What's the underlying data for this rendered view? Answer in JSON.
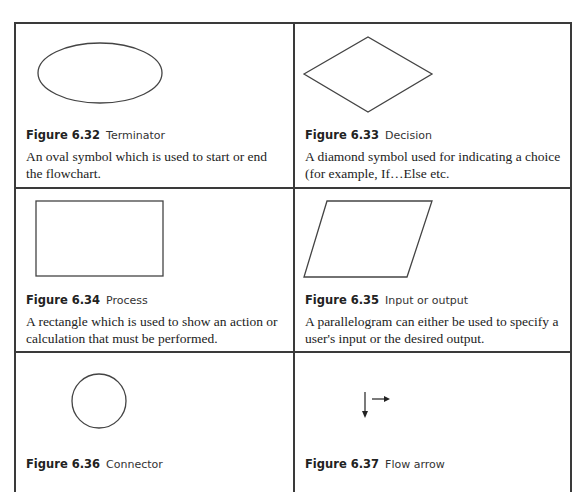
{
  "figures": [
    {
      "number": "Figure 6.32",
      "name": "Terminator",
      "shape": "oval-icon",
      "description": "An oval symbol which is used to start or end the flowchart."
    },
    {
      "number": "Figure 6.33",
      "name": "Decision",
      "shape": "diamond-icon",
      "description": "A diamond symbol used for indicating a choice (for example, If…Else etc."
    },
    {
      "number": "Figure 6.34",
      "name": "Process",
      "shape": "rectangle-icon",
      "description": "A rectangle which is used to show an action or calculation that must be performed."
    },
    {
      "number": "Figure 6.35",
      "name": "Input or output",
      "shape": "parallelogram-icon",
      "description": "A parallelogram can either be used to specify a user's input or the desired output."
    },
    {
      "number": "Figure 6.36",
      "name": "Connector",
      "shape": "circle-icon",
      "description": ""
    },
    {
      "number": "Figure 6.37",
      "name": "Flow arrow",
      "shape": "arrow-icon",
      "description": ""
    }
  ],
  "colors": {
    "border": "#3a3a3a",
    "shape_stroke": "#444444",
    "text": "#222222"
  }
}
